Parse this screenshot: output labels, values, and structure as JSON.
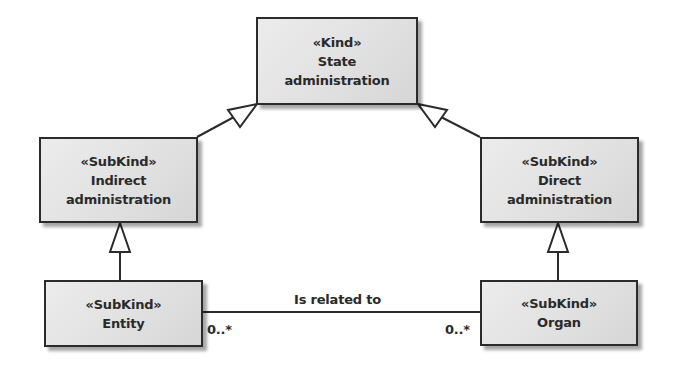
{
  "diagram": {
    "type": "UML class diagram (OntoUML)",
    "classes": [
      {
        "id": "state_admin",
        "stereotype": "«Kind»",
        "name_lines": [
          "State",
          "administration"
        ]
      },
      {
        "id": "indirect_admin",
        "stereotype": "«SubKind»",
        "name_lines": [
          "Indirect",
          "administration"
        ]
      },
      {
        "id": "direct_admin",
        "stereotype": "«SubKind»",
        "name_lines": [
          "Direct",
          "administration"
        ]
      },
      {
        "id": "entity",
        "stereotype": "«SubKind»",
        "name_lines": [
          "Entity"
        ]
      },
      {
        "id": "organ",
        "stereotype": "«SubKind»",
        "name_lines": [
          "Organ"
        ]
      }
    ],
    "generalizations": [
      {
        "from": "indirect_admin",
        "to": "state_admin"
      },
      {
        "from": "direct_admin",
        "to": "state_admin"
      },
      {
        "from": "entity",
        "to": "indirect_admin"
      },
      {
        "from": "organ",
        "to": "direct_admin"
      }
    ],
    "associations": [
      {
        "from": "entity",
        "to": "organ",
        "label": "Is related to",
        "from_multiplicity": "0..*",
        "to_multiplicity": "0..*"
      }
    ]
  },
  "colors": {
    "box_fill": "#e2e2e2",
    "stroke": "#2b2b2b",
    "text": "#2a2a2a",
    "background": "#ffffff"
  }
}
